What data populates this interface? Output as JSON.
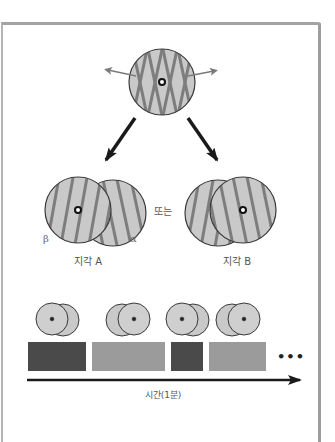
{
  "figure": {
    "type": "binocular-rivalry-diagram",
    "stimulus": {
      "description": "Dichoptic stimulus: two orthogonally oriented gratings fused in one circle with fixation dot",
      "fill_color": "#c9c9c9",
      "stripe_color": "#7a7a7a"
    },
    "separator_label": "또는",
    "percepts": [
      {
        "label": "지각 A",
        "dominant": "β",
        "front_side": "left"
      },
      {
        "label": "지각 B",
        "dominant": "α",
        "front_side": "right"
      }
    ],
    "eye_labels": {
      "beta": "β",
      "alpha": "α"
    },
    "timeline": {
      "axis_label": "시간(1분)",
      "continuation": "•••",
      "segments": [
        {
          "percept": "A",
          "shade": "dark",
          "color": "#4a4a4a"
        },
        {
          "percept": "B",
          "shade": "light",
          "color": "#9b9b9b"
        },
        {
          "percept": "A",
          "shade": "dark",
          "color": "#4a4a4a"
        },
        {
          "percept": "B",
          "shade": "light",
          "color": "#9b9b9b"
        }
      ]
    },
    "colors": {
      "frame": "#a3a3a3",
      "arrow": "#1a1a1a",
      "circle_outline": "#3a3a3a"
    }
  }
}
